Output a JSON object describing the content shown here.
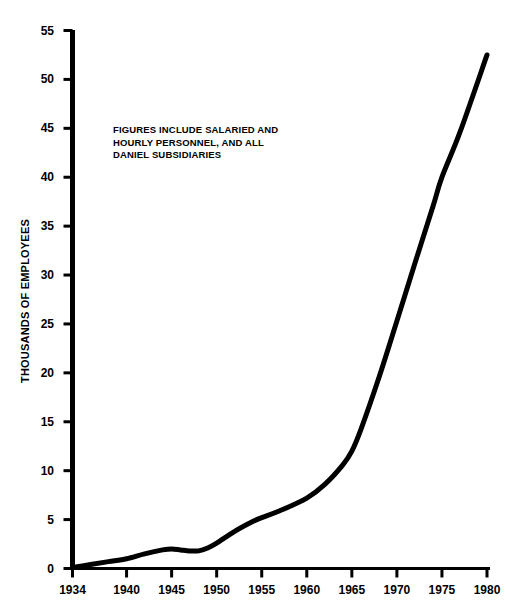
{
  "chart_data": {
    "type": "line",
    "title": "",
    "xlabel": "",
    "ylabel": "THOUSANDS OF EMPLOYEES",
    "xlim": [
      1934,
      1980
    ],
    "ylim": [
      0,
      55
    ],
    "xticks": [
      1934,
      1940,
      1945,
      1950,
      1955,
      1960,
      1965,
      1970,
      1975,
      1980
    ],
    "xticklabels": [
      "1934",
      "1940",
      "1945",
      "1950",
      "1955",
      "1960",
      "1965",
      "1970",
      "1975",
      "1980"
    ],
    "yticks": [
      0,
      5,
      10,
      15,
      20,
      25,
      30,
      35,
      40,
      45,
      50,
      55
    ],
    "yticklabels": [
      "0",
      "5",
      "10",
      "15",
      "20",
      "25",
      "30",
      "35",
      "40",
      "45",
      "50",
      "55"
    ],
    "grid": false,
    "legend": null,
    "annotations": [
      {
        "text": "FIGURES INCLUDE SALARIED AND\nHOURLY PERSONNEL, AND ALL\nDANIEL SUBSIDIARIES",
        "x": 1943,
        "y": 44
      }
    ],
    "line_color": "#000000",
    "line_width": 5,
    "series": [
      {
        "name": "Employees",
        "x": [
          1934,
          1936,
          1938,
          1940,
          1942,
          1944,
          1945,
          1946,
          1947,
          1948,
          1949,
          1950,
          1952,
          1954,
          1955,
          1957,
          1960,
          1962,
          1964,
          1965,
          1966,
          1968,
          1970,
          1972,
          1974,
          1975,
          1977,
          1980
        ],
        "values": [
          0.1,
          0.4,
          0.7,
          1.0,
          1.5,
          1.9,
          2.0,
          1.9,
          1.8,
          1.8,
          2.1,
          2.6,
          3.8,
          4.8,
          5.2,
          5.9,
          7.2,
          8.6,
          10.6,
          12.0,
          14.2,
          19.5,
          25.3,
          31.2,
          37.0,
          40.0,
          44.6,
          52.5
        ]
      }
    ]
  },
  "axis": {
    "y_axis_name": "y-axis",
    "x_axis_name": "x-axis"
  }
}
